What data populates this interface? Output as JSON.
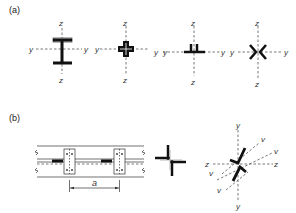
{
  "panel_a": {
    "label": "(a)",
    "sections": [
      {
        "name": "i-section",
        "axes": {
          "horizontal": "y",
          "vertical": "z"
        }
      },
      {
        "name": "cruciform-section",
        "axes": {
          "horizontal": "y",
          "vertical": "z"
        }
      },
      {
        "name": "back-to-back-angles-section",
        "axes": {
          "horizontal": "y",
          "vertical": "z"
        }
      },
      {
        "name": "star-angles-section",
        "axes": {
          "horizontal": "y",
          "vertical": "z"
        }
      }
    ]
  },
  "panel_b": {
    "label": "(b)",
    "spacing_label": "a",
    "star_axes": {
      "y": "y",
      "z": "z",
      "v": "v"
    }
  },
  "axis_labels": {
    "y": "y",
    "z": "z",
    "v": "v"
  }
}
